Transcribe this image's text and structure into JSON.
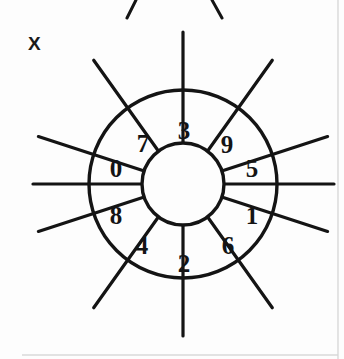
{
  "figure": {
    "label": "X",
    "type": "numbered-wheel-diagram",
    "sector_count": 10,
    "colors": {
      "stroke": "#141414",
      "background": "#fdfdfd",
      "border": "#d8d8d8"
    }
  },
  "wheel": {
    "center_x": 183,
    "center_y": 184,
    "inner_radius": 41,
    "outer_radius": 94,
    "spoke_outer_radius": 152,
    "sector_span_degrees": 36,
    "sectors": [
      {
        "label": "3",
        "angle_deg": -72,
        "label_x": 184,
        "label_y": 130
      },
      {
        "label": "9",
        "angle_deg": -36,
        "label_x": 227,
        "label_y": 144
      },
      {
        "label": "5",
        "angle_deg": 0,
        "label_x": 252,
        "label_y": 181
      },
      {
        "label": "1",
        "angle_deg": 36,
        "label_x": 252,
        "label_y": 222
      },
      {
        "label": "6",
        "angle_deg": 72,
        "label_x": 228,
        "label_y": 258
      },
      {
        "label": "2",
        "angle_deg": 108,
        "label_x": 184,
        "label_y": 274
      },
      {
        "label": "4",
        "angle_deg": 144,
        "label_x": 142,
        "label_y": 258
      },
      {
        "label": "8",
        "angle_deg": 180,
        "label_x": 116,
        "label_y": 222
      },
      {
        "label": "0",
        "angle_deg": 216,
        "label_x": 116,
        "label_y": 180
      },
      {
        "label": "7",
        "angle_deg": 252,
        "label_x": 143,
        "label_y": 143
      }
    ],
    "spoke_angles_deg": [
      18,
      54,
      90,
      126,
      162,
      198,
      234,
      270,
      306,
      342
    ],
    "horizontal_axis": {
      "x1": 33,
      "y1": 184,
      "x2": 334,
      "y2": 184
    }
  },
  "partial_wheel_above": {
    "visible": true,
    "fragment_count": 4
  },
  "page_rules": {
    "right_border_x": 338,
    "bottom_rule_y": 355
  }
}
